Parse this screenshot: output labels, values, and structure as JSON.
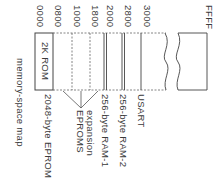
{
  "diagram": {
    "title": "memory-space map",
    "addresses": [
      {
        "label": "0000",
        "x": 45
      },
      {
        "label": "0800",
        "x": 63
      },
      {
        "label": "1000",
        "x": 82
      },
      {
        "label": "1800",
        "x": 100
      },
      {
        "label": "2000",
        "x": 115
      },
      {
        "label": "2800",
        "x": 133
      },
      {
        "label": "3000",
        "x": 152
      },
      {
        "label": "FFFF",
        "x": 214
      }
    ],
    "regions": {
      "rom": "2K ROM",
      "eprom": "2048-byte EPROM",
      "expansion_line1": "expansion",
      "expansion_line2": "EPROMS",
      "ram1": "256-byte RAM-1",
      "ram2": "256-byte RAM-2",
      "usart": "USART"
    },
    "colors": {
      "line": "#444444",
      "dashed": "#666666",
      "text": "#3a3a3a"
    }
  }
}
